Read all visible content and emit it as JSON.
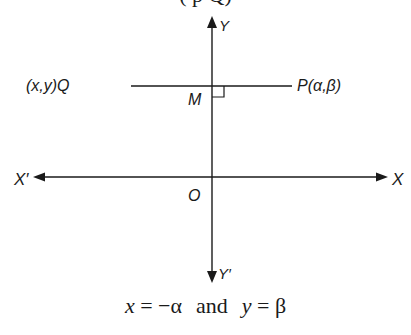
{
  "top_fragment": "( p Q)",
  "diagram": {
    "axes": {
      "y_positive_label": "Y",
      "y_negative_label": "Y′",
      "x_positive_label": "X",
      "x_negative_label": "X′",
      "origin_label": "O"
    },
    "points": {
      "Q_label": "(x,y)Q",
      "P_label": "P(α,β)",
      "M_label": "M"
    },
    "colors": {
      "line": "#1a1a1a",
      "background": "#ffffff"
    }
  },
  "caption": {
    "x_var": "x",
    "x_eq": " = −α",
    "and": "and",
    "y_var": "y",
    "y_eq": " = β"
  }
}
